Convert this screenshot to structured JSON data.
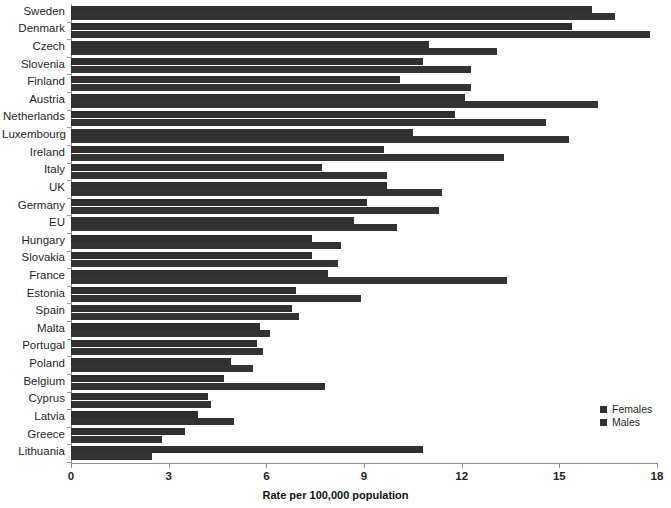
{
  "chart_data": {
    "type": "bar",
    "orientation": "horizontal",
    "title": "",
    "xlabel": "Rate per 100,000 population",
    "ylabel": "",
    "xlim": [
      0,
      18
    ],
    "xticks": [
      0,
      3,
      6,
      9,
      12,
      15,
      18
    ],
    "grid": false,
    "legend_position": "bottom-right",
    "categories": [
      "Sweden",
      "Denmark",
      "Czech",
      "Slovenia",
      "Finland",
      "Austria",
      "Netherlands",
      "Luxembourg",
      "Ireland",
      "Italy",
      "UK",
      "Germany",
      "EU",
      "Hungary",
      "Slovakia",
      "France",
      "Estonia",
      "Spain",
      "Malta",
      "Portugal",
      "Poland",
      "Belgium",
      "Cyprus",
      "Latvia",
      "Greece",
      "Lithuania"
    ],
    "series": [
      {
        "name": "Females",
        "color": "#2f2f2f",
        "values": [
          16.0,
          15.4,
          11.0,
          10.8,
          10.1,
          12.1,
          11.8,
          10.5,
          9.6,
          7.7,
          9.7,
          9.1,
          8.7,
          7.4,
          7.4,
          7.9,
          6.9,
          6.8,
          5.8,
          5.7,
          4.9,
          4.7,
          4.2,
          3.9,
          3.5,
          10.8
        ]
      },
      {
        "name": "Males",
        "color": "#333333",
        "values": [
          16.7,
          17.8,
          13.1,
          12.3,
          12.3,
          16.2,
          14.6,
          15.3,
          13.3,
          9.7,
          11.4,
          11.3,
          10.0,
          8.3,
          8.2,
          13.4,
          8.9,
          7.0,
          6.1,
          5.9,
          5.6,
          7.8,
          4.3,
          5.0,
          2.8,
          2.5
        ]
      }
    ]
  },
  "legend": {
    "items": [
      {
        "label": "Females"
      },
      {
        "label": "Males"
      }
    ]
  }
}
